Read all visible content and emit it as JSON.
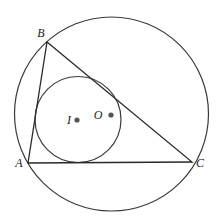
{
  "diagram": {
    "colors": {
      "stroke": "#3a3a3a",
      "point": "#555555",
      "label": "#222222",
      "background": "#ffffff"
    },
    "circumcircle": {
      "center": "O",
      "cx": 111.5,
      "cy": 114,
      "r": 97
    },
    "incircle": {
      "center": "I",
      "cx": 78,
      "cy": 119.5,
      "r": 43
    },
    "vertices": [
      {
        "name": "A",
        "label": "A",
        "x": 28,
        "y": 163,
        "label_x": 19,
        "label_y": 163
      },
      {
        "name": "B",
        "label": "B",
        "x": 47,
        "y": 42,
        "label_x": 41,
        "label_y": 33
      },
      {
        "name": "C",
        "label": "C",
        "x": 192,
        "y": 162,
        "label_x": 200,
        "label_y": 163
      }
    ],
    "centers": [
      {
        "name": "I",
        "label": "I",
        "x": 77,
        "y": 120,
        "label_x": 69,
        "label_y": 120
      },
      {
        "name": "O",
        "label": "O",
        "x": 111,
        "y": 115,
        "label_x": 98,
        "label_y": 115
      }
    ]
  }
}
